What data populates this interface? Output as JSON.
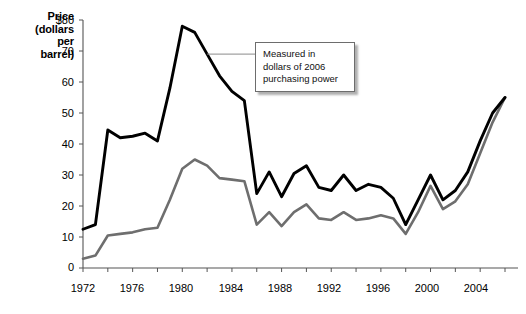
{
  "chart_data": {
    "type": "line",
    "title": "",
    "subtitle": "",
    "xlabel": "",
    "ylabel": "Price (dollars per barrel)",
    "ylabel_lines": [
      "Price",
      "(dollars",
      "per",
      "barrel)"
    ],
    "xlim": [
      1972,
      2006
    ],
    "ylim": [
      0,
      80
    ],
    "grid": false,
    "legend_position": "none",
    "y_ticks": [
      0,
      10,
      20,
      30,
      40,
      50,
      60,
      70,
      80
    ],
    "y_tick_labels": [
      "0",
      "10",
      "20",
      "30",
      "40",
      "50",
      "60",
      "70",
      "$80"
    ],
    "x_ticks": [
      1972,
      1976,
      1980,
      1984,
      1988,
      1992,
      1996,
      2000,
      2004
    ],
    "x_tick_labels": [
      "1972",
      "1976",
      "1980",
      "1984",
      "1988",
      "1992",
      "1996",
      "2000",
      "2004"
    ],
    "x_minor_ticks": [
      1974,
      1978,
      1982,
      1986,
      1990,
      1994,
      1998,
      2002,
      2006
    ],
    "x": [
      1972,
      1973,
      1974,
      1975,
      1976,
      1977,
      1978,
      1979,
      1980,
      1981,
      1982,
      1983,
      1984,
      1985,
      1986,
      1987,
      1988,
      1989,
      1990,
      1991,
      1992,
      1993,
      1994,
      1995,
      1996,
      1997,
      1998,
      1999,
      2000,
      2001,
      2002,
      2003,
      2004,
      2005,
      2006
    ],
    "series": [
      {
        "name": "Real price (2006 dollars)",
        "color": "#000000",
        "values": [
          12.5,
          14.0,
          44.5,
          42.0,
          42.5,
          43.5,
          41.0,
          58.0,
          78.0,
          76.0,
          69.0,
          62.0,
          57.0,
          54.0,
          24.0,
          31.0,
          23.0,
          30.5,
          33.0,
          26.0,
          25.0,
          30.0,
          25.0,
          27.0,
          26.0,
          22.5,
          14.0,
          22.0,
          30.0,
          22.0,
          25.0,
          31.0,
          41.0,
          50.0,
          55.0
        ]
      },
      {
        "name": "Nominal price",
        "color": "#6e6e6e",
        "values": [
          3.0,
          4.0,
          10.5,
          11.0,
          11.5,
          12.5,
          13.0,
          22.0,
          32.0,
          35.0,
          33.0,
          29.0,
          28.5,
          28.0,
          14.0,
          18.0,
          13.5,
          18.0,
          20.5,
          16.0,
          15.5,
          18.0,
          15.5,
          16.0,
          17.0,
          16.0,
          11.0,
          18.0,
          26.5,
          19.0,
          21.5,
          27.0,
          37.0,
          47.0,
          55.0
        ]
      }
    ],
    "annotations": [
      {
        "id": "measurement-note",
        "lines": [
          "Measured in",
          "dollars of 2006",
          "purchasing power"
        ],
        "text": "Measured in dollars of 2006 purchasing power",
        "leader_target_year": 1982,
        "leader_target_value": 69
      }
    ]
  },
  "axis": {
    "ylabel_lines": [
      "Price",
      "(dollars",
      "per",
      "barrel)"
    ]
  },
  "annotation": {
    "line1": "Measured in",
    "line2": "dollars of 2006",
    "line3": "purchasing power"
  },
  "colors": {
    "series_real": "#000000",
    "series_nominal": "#6e6e6e",
    "axis": "#555555",
    "annotation_border": "#6d6d6d",
    "background": "#ffffff"
  }
}
